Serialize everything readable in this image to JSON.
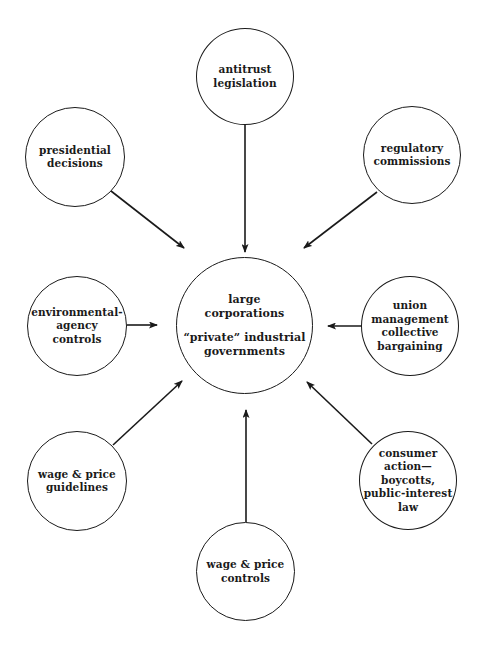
{
  "diagram": {
    "center": {
      "line1": "large",
      "line2": "corporations",
      "line3": "“private” industrial",
      "line4": "governments"
    },
    "nodes": [
      {
        "id": "antitrust",
        "lines": [
          "antitrust",
          "legislation"
        ]
      },
      {
        "id": "presidential",
        "lines": [
          "presidential",
          "decisions"
        ]
      },
      {
        "id": "regulatory",
        "lines": [
          "regulatory",
          "commissions"
        ]
      },
      {
        "id": "environmental",
        "lines": [
          "environmental-",
          "agency",
          "controls"
        ]
      },
      {
        "id": "union",
        "lines": [
          "union",
          "management",
          "collective",
          "bargaining"
        ]
      },
      {
        "id": "wage-guidelines",
        "lines": [
          "wage & price",
          "guidelines"
        ]
      },
      {
        "id": "consumer",
        "lines": [
          "consumer",
          "action—boycotts,",
          "public-interest",
          "law"
        ]
      },
      {
        "id": "wage-controls",
        "lines": [
          "wage & price",
          "controls"
        ]
      }
    ],
    "edges": [
      {
        "from": "antitrust",
        "to": "center"
      },
      {
        "from": "presidential",
        "to": "center"
      },
      {
        "from": "regulatory",
        "to": "center"
      },
      {
        "from": "environmental",
        "to": "center"
      },
      {
        "from": "union",
        "to": "center"
      },
      {
        "from": "wage-guidelines",
        "to": "center"
      },
      {
        "from": "consumer",
        "to": "center"
      },
      {
        "from": "wage-controls",
        "to": "center"
      }
    ],
    "colors": {
      "stroke": "#1a1a1a",
      "background": "#ffffff"
    }
  }
}
